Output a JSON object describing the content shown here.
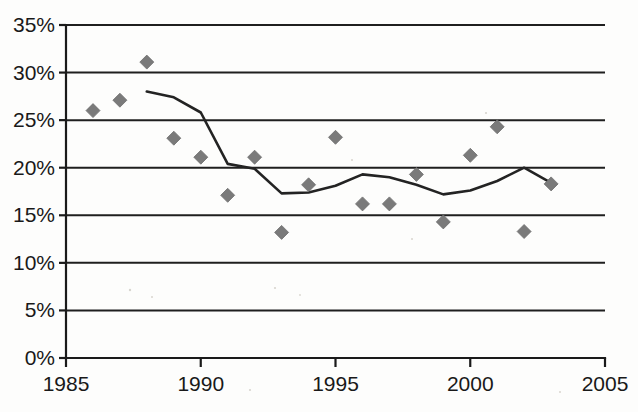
{
  "chart_data": {
    "type": "scatter",
    "title": "",
    "subtitle": "",
    "xlabel": "",
    "ylabel": "",
    "xlim": [
      1985,
      2005
    ],
    "ylim": [
      0,
      35
    ],
    "grid": true,
    "legend": null,
    "x_tick_labels": [
      "1985",
      "1990",
      "1995",
      "2000",
      "2005"
    ],
    "x_ticks": [
      1985,
      1990,
      1995,
      2000,
      2005
    ],
    "y_tick_labels": [
      "0%",
      "5%",
      "10%",
      "15%",
      "20%",
      "25%",
      "30%",
      "35%"
    ],
    "y_ticks": [
      0,
      5,
      10,
      15,
      20,
      25,
      30,
      35
    ],
    "y_unit": "%",
    "series": [
      {
        "name": "data-points",
        "type": "scatter",
        "marker": "diamond",
        "color": "#7a7a7a",
        "x": [
          1986,
          1987,
          1988,
          1989,
          1990,
          1991,
          1992,
          1993,
          1994,
          1995,
          1996,
          1997,
          1998,
          1999,
          2000,
          2001,
          2002,
          2003
        ],
        "values": [
          26.0,
          27.1,
          31.1,
          23.1,
          21.1,
          17.1,
          21.1,
          13.2,
          18.2,
          23.2,
          16.2,
          16.2,
          19.3,
          14.3,
          21.3,
          24.3,
          13.3,
          18.3
        ]
      },
      {
        "name": "trend-line",
        "type": "line",
        "color": "#232323",
        "x": [
          1988,
          1989,
          1990,
          1991,
          1992,
          1993,
          1994,
          1995,
          1996,
          1997,
          1998,
          1999,
          2000,
          2001,
          2002,
          2003
        ],
        "values": [
          28.0,
          27.4,
          25.8,
          20.4,
          19.9,
          17.3,
          17.4,
          18.1,
          19.3,
          19.0,
          18.2,
          17.2,
          17.6,
          18.6,
          20.0,
          18.4
        ]
      }
    ]
  }
}
